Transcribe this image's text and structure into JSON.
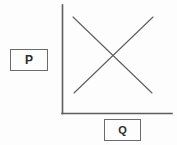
{
  "figure": {
    "background_color": "#fdfdfd",
    "line_color": "#5d5d5d",
    "label_border_color": "#6b6b6b",
    "label_text_color": "#2b2b2b"
  },
  "axes": {
    "vertical_axis": {
      "name": "price-axis",
      "x": 62,
      "y_top": 5,
      "y_bottom": 113
    },
    "horizontal_axis": {
      "name": "quantity-axis",
      "y": 113,
      "x_left": 62,
      "x_right": 172
    }
  },
  "labels": {
    "price": {
      "text": "P",
      "meaning": "price"
    },
    "quantity": {
      "text": "Q",
      "meaning": "quantity"
    }
  },
  "chart_data": {
    "type": "line",
    "title": "",
    "xlabel": "Q",
    "ylabel": "P",
    "grid": false,
    "legend": "none",
    "xlim": [
      0,
      100
    ],
    "ylim": [
      0,
      100
    ],
    "series": [
      {
        "name": "demand",
        "slope": "negative",
        "x": [
          10,
          82
        ],
        "y": [
          89,
          19
        ],
        "pixel_start": [
          73,
          17
        ],
        "pixel_end": [
          152,
          93
        ]
      },
      {
        "name": "supply",
        "slope": "positive",
        "x": [
          11,
          83
        ],
        "y": [
          19,
          89
        ],
        "pixel_start": [
          74,
          93
        ],
        "pixel_end": [
          153,
          17
        ]
      }
    ],
    "annotations": [
      {
        "name": "equilibrium",
        "x": 46,
        "y": 54,
        "pixel": [
          113,
          55
        ],
        "label": ""
      }
    ]
  }
}
